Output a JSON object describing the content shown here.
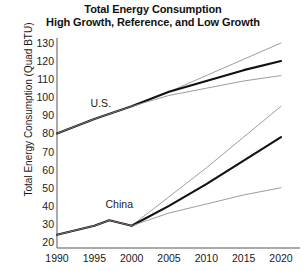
{
  "chart_data": {
    "type": "line",
    "title": "Total Energy Consumption",
    "subtitle": "High Growth, Reference, and Low Growth",
    "xlabel": "",
    "ylabel": "Total Energy Consumption (Quad BTU)",
    "xlim": [
      1990,
      2020
    ],
    "ylim": [
      20,
      130
    ],
    "xticks": [
      1990,
      1995,
      2000,
      2005,
      2010,
      2015,
      2020
    ],
    "yticks": [
      20,
      30,
      40,
      50,
      60,
      70,
      80,
      90,
      100,
      110,
      120,
      130
    ],
    "grid": false,
    "legend_position": "inline-annotation",
    "annotations": [
      {
        "text": "U.S.",
        "x": 1994.5,
        "y": 97
      },
      {
        "text": "China",
        "x": 1996.5,
        "y": 41
      }
    ],
    "groups": [
      {
        "name": "U.S.",
        "series": [
          {
            "name": "High Growth",
            "style": "thin",
            "x": [
              1990,
              1995,
              2000,
              2005,
              2010,
              2015,
              2020
            ],
            "values": [
              80,
              88,
              95,
              103,
              112,
              121,
              130
            ]
          },
          {
            "name": "Reference",
            "style": "thick",
            "x": [
              1990,
              1995,
              2000,
              2005,
              2010,
              2015,
              2020
            ],
            "values": [
              80,
              88,
              95,
              103,
              109,
              115,
              120
            ]
          },
          {
            "name": "Low Growth",
            "style": "thin",
            "x": [
              1990,
              1995,
              2000,
              2005,
              2010,
              2015,
              2020
            ],
            "values": [
              80,
              88,
              95,
              101,
              105,
              109,
              112
            ]
          }
        ]
      },
      {
        "name": "China",
        "series": [
          {
            "name": "High Growth",
            "style": "thin",
            "x": [
              1990,
              1995,
              1997,
              2000,
              2005,
              2010,
              2015,
              2020
            ],
            "values": [
              24,
              29,
              32,
              29,
              45,
              61,
              78,
              95
            ]
          },
          {
            "name": "Reference",
            "style": "thick",
            "x": [
              1990,
              1995,
              1997,
              2000,
              2005,
              2010,
              2015,
              2020
            ],
            "values": [
              24,
              29,
              32,
              29,
              40,
              52,
              65,
              78
            ]
          },
          {
            "name": "Low Growth",
            "style": "thin",
            "x": [
              1990,
              1995,
              1997,
              2000,
              2005,
              2010,
              2015,
              2020
            ],
            "values": [
              24,
              29,
              32,
              29,
              36,
              41,
              46,
              50
            ]
          }
        ]
      }
    ],
    "colors": {
      "reference_line": "#111111",
      "bound_line": "#8a8a8a",
      "axis": "#555555",
      "text": "#1a1a1a"
    }
  }
}
